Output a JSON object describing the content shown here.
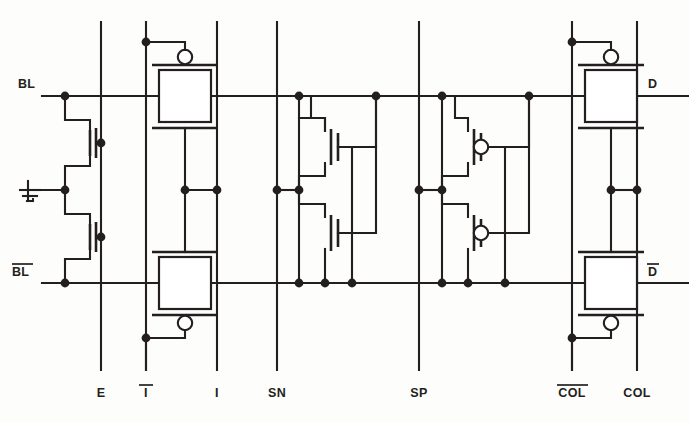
{
  "figure": {
    "type": "schematic",
    "caption": ""
  },
  "labels": {
    "left": [
      {
        "id": "bl",
        "text": "BL",
        "overbar": false,
        "x": 18,
        "y": 90
      },
      {
        "id": "bl_bar",
        "text": "BL",
        "overbar": true,
        "x": 12,
        "y": 275
      }
    ],
    "right": [
      {
        "id": "d",
        "text": "D",
        "overbar": false,
        "x": 648,
        "y": 90
      },
      {
        "id": "d_bar",
        "text": "D",
        "overbar": true,
        "x": 648,
        "y": 275
      }
    ],
    "bottom": [
      {
        "id": "e",
        "text": "E",
        "overbar": false,
        "x": 101
      },
      {
        "id": "i_bar",
        "text": "I",
        "overbar": true,
        "x": 146
      },
      {
        "id": "i",
        "text": "I",
        "overbar": false,
        "x": 217
      },
      {
        "id": "sn",
        "text": "SN",
        "overbar": false,
        "x": 277
      },
      {
        "id": "sp",
        "text": "SP",
        "overbar": false,
        "x": 419
      },
      {
        "id": "col_bar",
        "text": "COL",
        "overbar": true,
        "x": 572
      },
      {
        "id": "col",
        "text": "COL",
        "overbar": false,
        "x": 637
      }
    ]
  },
  "nets": {
    "bl_y": 96,
    "bl_bar_y": 283,
    "mid_y": 190,
    "top_y": 22,
    "bottom_y": 370
  },
  "colors": {
    "ink": "#231f20",
    "paper": "#fdfdfb",
    "fill": "#ffffff"
  },
  "components": {
    "equalizer": {
      "name": "equalization-pair",
      "gate_net": "E",
      "count": 2
    },
    "ground": {
      "name": "ground-symbol",
      "x": 28,
      "y": 190
    },
    "isolation_gates": {
      "name": "isolation-transmission-gates",
      "gate_nets": [
        "I",
        "I-bar"
      ],
      "count": 2
    },
    "nmos_latch": {
      "name": "nmos-cross-coupled-pair",
      "gate_net": "SN",
      "count": 2
    },
    "pmos_latch": {
      "name": "pmos-cross-coupled-pair",
      "gate_net": "SP",
      "count": 2
    },
    "column_gates": {
      "name": "column-select-transmission-gates",
      "gate_nets": [
        "COL",
        "COL-bar"
      ],
      "count": 2
    }
  }
}
